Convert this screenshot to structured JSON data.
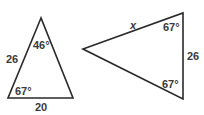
{
  "diagram": {
    "triangle_left": {
      "vertices": {
        "apex": [
          41,
          18
        ],
        "bottom_left": [
          8,
          98
        ],
        "bottom_right": [
          73,
          98
        ]
      },
      "labels": {
        "apex_angle": "46°",
        "bottom_left_angle": "67°",
        "left_side": "26",
        "bottom_side": "20"
      }
    },
    "triangle_right": {
      "vertices": {
        "left": [
          83,
          49
        ],
        "top_right": [
          183,
          13
        ],
        "bottom_right": [
          183,
          99
        ]
      },
      "labels": {
        "top_side": "x",
        "top_right_angle": "67°",
        "bottom_right_angle": "67°",
        "right_side": "26"
      }
    },
    "colors": {
      "stroke": "#2a2a2a",
      "text": "#3a3a3a",
      "background": "#ffffff"
    }
  }
}
